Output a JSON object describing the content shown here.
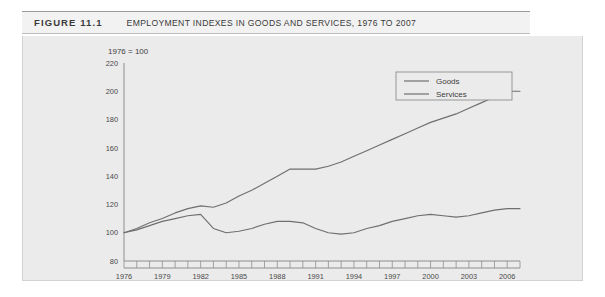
{
  "figure": {
    "number_label": "FIGURE 11.1",
    "title": "EMPLOYMENT INDEXES IN GOODS AND SERVICES, 1976 TO 2007"
  },
  "chart_data": {
    "type": "line",
    "title": "EMPLOYMENT INDEXES IN GOODS AND SERVICES, 1976 TO 2007",
    "subtitle": "1976 = 100",
    "xlabel": "",
    "ylabel": "",
    "ylim": [
      80,
      220
    ],
    "ytick_step": 20,
    "yticks": [
      80,
      100,
      120,
      140,
      160,
      180,
      200,
      220
    ],
    "ytick_labels": [
      "80",
      "100",
      "120",
      "140",
      "160",
      "180",
      "200",
      "220"
    ],
    "xlim": [
      1976,
      2007
    ],
    "xticks": [
      1976,
      1977,
      1978,
      1979,
      1980,
      1981,
      1982,
      1983,
      1984,
      1985,
      1986,
      1987,
      1988,
      1989,
      1990,
      1991,
      1992,
      1993,
      1994,
      1995,
      1996,
      1997,
      1998,
      1999,
      2000,
      2001,
      2002,
      2003,
      2004,
      2005,
      2006,
      2007
    ],
    "xtick_labels_shown": [
      "1976",
      "1979",
      "1982",
      "1985",
      "1988",
      "1991",
      "1994",
      "1997",
      "2000",
      "2003",
      "2006"
    ],
    "xtick_label_step": 3,
    "grid": false,
    "legend_position": "top-right",
    "x": [
      1976,
      1977,
      1978,
      1979,
      1980,
      1981,
      1982,
      1983,
      1984,
      1985,
      1986,
      1987,
      1988,
      1989,
      1990,
      1991,
      1992,
      1993,
      1994,
      1995,
      1996,
      1997,
      1998,
      1999,
      2000,
      2001,
      2002,
      2003,
      2004,
      2005,
      2006,
      2007
    ],
    "series": [
      {
        "name": "Goods",
        "color": "#6f6f6f",
        "values": [
          100,
          102,
          105,
          108,
          110,
          112,
          113,
          103,
          100,
          101,
          103,
          106,
          108,
          108,
          107,
          103,
          100,
          99,
          100,
          103,
          105,
          108,
          110,
          112,
          113,
          112,
          111,
          112,
          114,
          116,
          117,
          117
        ]
      },
      {
        "name": "Services",
        "color": "#6f6f6f",
        "values": [
          100,
          103,
          107,
          110,
          114,
          117,
          119,
          118,
          121,
          126,
          130,
          135,
          140,
          145,
          145,
          145,
          147,
          150,
          154,
          158,
          162,
          166,
          170,
          174,
          178,
          181,
          184,
          188,
          192,
          196,
          200,
          200
        ]
      }
    ],
    "legend": [
      "Goods",
      "Services"
    ]
  }
}
